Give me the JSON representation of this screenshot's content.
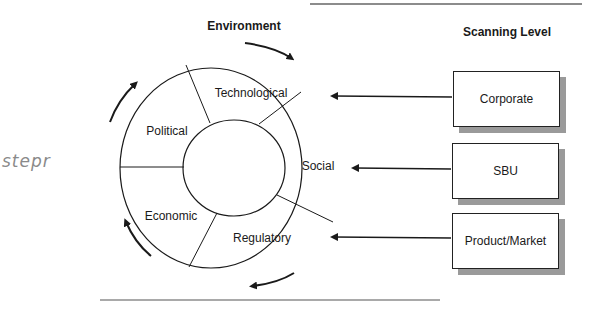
{
  "titles": {
    "environment": "Environment",
    "scanning_level": "Scanning Level"
  },
  "segments": [
    {
      "id": "technological",
      "label": "Technological"
    },
    {
      "id": "political",
      "label": "Political"
    },
    {
      "id": "social",
      "label": "Social"
    },
    {
      "id": "economic",
      "label": "Economic"
    },
    {
      "id": "regulatory",
      "label": "Regulatory"
    }
  ],
  "levels": [
    {
      "id": "corporate",
      "label": "Corporate",
      "points_to": "Technological"
    },
    {
      "id": "sbu",
      "label": "SBU",
      "points_to": "Social"
    },
    {
      "id": "product-market",
      "label": "Product/Market",
      "points_to": "Regulatory"
    }
  ],
  "annotation": {
    "handwritten": "stepr"
  },
  "colors": {
    "line": "#1a1a1a",
    "shadow": "#9a9a9a",
    "rule": "#8c8c8c"
  }
}
